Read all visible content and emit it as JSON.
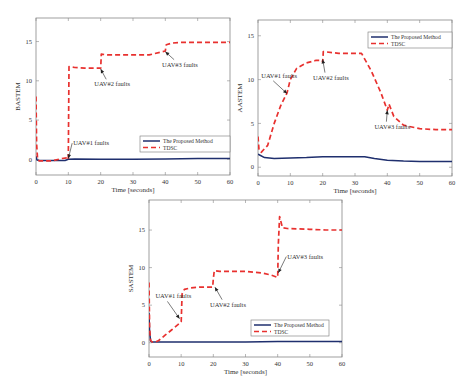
{
  "chart_data": [
    {
      "id": "bastem",
      "type": "line",
      "title": "",
      "xlabel": "Time [seconds]",
      "ylabel": "BASTEM",
      "xlim": [
        0,
        60
      ],
      "ylim": [
        -2,
        18
      ],
      "xticks": [
        0,
        10,
        20,
        30,
        40,
        50,
        60
      ],
      "yticks": [
        0,
        5,
        10,
        15
      ],
      "grid": false,
      "legend_position": "lower right",
      "frame": {
        "left": 36,
        "right": 230,
        "top": 18,
        "bottom": 175
      },
      "series": [
        {
          "name": "The Proposed Method",
          "style": "solid",
          "color": "#1f2f6e",
          "x": [
            0,
            0.3,
            1,
            5,
            9,
            10,
            12,
            20,
            30,
            40,
            50,
            60
          ],
          "y": [
            0.4,
            -0.1,
            -0.15,
            -0.15,
            -0.15,
            0.0,
            0.05,
            0.0,
            0.0,
            0.05,
            0.1,
            0.1
          ]
        },
        {
          "name": "TDSC",
          "style": "dashed",
          "color": "#e8312f",
          "x": [
            0,
            0.2,
            0.5,
            1,
            5,
            8,
            9.8,
            10,
            10.2,
            12,
            15,
            20,
            20.2,
            22,
            25,
            30,
            35,
            40,
            40.3,
            42,
            45,
            50,
            55,
            60
          ],
          "y": [
            8,
            2,
            0,
            -0.2,
            -0.2,
            0.1,
            0.2,
            0.0,
            11.8,
            11.7,
            11.6,
            11.6,
            13.4,
            13.3,
            13.3,
            13.3,
            13.3,
            13.8,
            14.6,
            14.8,
            14.9,
            14.9,
            14.9,
            14.9
          ]
        }
      ],
      "annotations": [
        {
          "text": "UAV#1 faults",
          "x": 11.5,
          "y": 1.8,
          "arrow_to": [
            10,
            0.1
          ]
        },
        {
          "text": "UAV#2 faults",
          "x": 18,
          "y": 9.3,
          "arrow_to": [
            20,
            11.5
          ]
        },
        {
          "text": "UAV#3 faults",
          "x": 39,
          "y": 11.8,
          "arrow_to": [
            40,
            13.7
          ]
        }
      ]
    },
    {
      "id": "aastem",
      "type": "line",
      "title": "",
      "xlabel": "Time [seconds]",
      "ylabel": "AASTEM",
      "xlim": [
        0,
        60
      ],
      "ylim": [
        -1,
        16.8
      ],
      "xticks": [
        0,
        10,
        20,
        30,
        40,
        50,
        60
      ],
      "yticks": [
        0,
        5,
        10,
        15
      ],
      "grid": false,
      "legend_position": "upper right",
      "frame": {
        "left": 258,
        "right": 452,
        "top": 20,
        "bottom": 176
      },
      "series": [
        {
          "name": "The Proposed Method",
          "style": "solid",
          "color": "#1f2f6e",
          "x": [
            0,
            0.5,
            2,
            5,
            10,
            15,
            20,
            25,
            30,
            33,
            36,
            40,
            45,
            50,
            60
          ],
          "y": [
            1.5,
            1.4,
            1.1,
            1.0,
            1.05,
            1.1,
            1.2,
            1.2,
            1.2,
            1.2,
            1.0,
            0.8,
            0.7,
            0.65,
            0.65
          ]
        },
        {
          "name": "TDSC",
          "style": "dashed",
          "color": "#e8312f",
          "x": [
            0,
            0.3,
            1,
            3,
            5,
            7,
            9,
            10,
            12,
            15,
            18,
            19.8,
            20,
            20.2,
            25,
            30,
            32,
            35,
            38,
            40,
            40.5,
            42,
            45,
            50,
            55,
            60
          ],
          "y": [
            3.5,
            2.0,
            1.7,
            2.5,
            5.0,
            7.0,
            8.5,
            10.0,
            11.3,
            11.9,
            12.2,
            12.2,
            12.0,
            13.2,
            13.0,
            13.0,
            13.0,
            11.0,
            8.5,
            6.5,
            7.2,
            5.8,
            4.8,
            4.4,
            4.3,
            4.3
          ]
        }
      ],
      "annotations": [
        {
          "text": "UAV#1 faults",
          "x": 1,
          "y": 10.2,
          "arrow_to": [
            9,
            8.4
          ]
        },
        {
          "text": "UAV#2 faults",
          "x": 17,
          "y": 10.0,
          "arrow_to": [
            20,
            12.3
          ]
        },
        {
          "text": "UAV#3 faults",
          "x": 36,
          "y": 4.4,
          "arrow_to": [
            40,
            6.5
          ]
        }
      ]
    },
    {
      "id": "sastem",
      "type": "line",
      "title": "",
      "xlabel": "Time [seconds]",
      "ylabel": "SASTEM",
      "xlim": [
        0,
        60
      ],
      "ylim": [
        -1.9,
        19
      ],
      "xticks": [
        0,
        10,
        20,
        30,
        40,
        50,
        60
      ],
      "yticks": [
        0,
        5,
        10,
        15
      ],
      "grid": false,
      "legend_position": "lower right",
      "frame": {
        "left": 149,
        "right": 342,
        "top": 200,
        "bottom": 357
      },
      "series": [
        {
          "name": "The Proposed Method",
          "style": "solid",
          "color": "#1f2f6e",
          "x": [
            0,
            0.2,
            0.5,
            1,
            5,
            10,
            20,
            30,
            40,
            50,
            60
          ],
          "y": [
            4.0,
            1.5,
            0.2,
            0.1,
            0.1,
            0.1,
            0.1,
            0.1,
            0.15,
            0.15,
            0.15
          ]
        },
        {
          "name": "TDSC",
          "style": "dashed",
          "color": "#e8312f",
          "x": [
            0,
            0.2,
            0.5,
            1,
            2,
            3,
            5,
            7,
            9,
            10,
            10.3,
            11,
            13,
            16,
            19.8,
            20,
            20.3,
            22,
            25,
            30,
            35,
            38,
            40,
            40.2,
            40.6,
            41.5,
            43,
            50,
            55,
            60
          ],
          "y": [
            8,
            2,
            0.3,
            0.1,
            0.1,
            0.3,
            1.0,
            1.7,
            2.4,
            2.8,
            6.5,
            7.1,
            7.3,
            7.4,
            7.4,
            8.5,
            9.6,
            9.5,
            9.5,
            9.5,
            9.3,
            9.0,
            8.7,
            13,
            16.8,
            15.3,
            15.2,
            15.1,
            15.0,
            15.0
          ]
        }
      ],
      "annotations": [
        {
          "text": "UAV#1 faults",
          "x": 2,
          "y": 5.9,
          "arrow_to": [
            9.5,
            3.2
          ]
        },
        {
          "text": "UAV#2 faults",
          "x": 19,
          "y": 4.8,
          "arrow_to": [
            20.5,
            7.4
          ]
        },
        {
          "text": "UAV#3 faults",
          "x": 43,
          "y": 11.2,
          "arrow_to": [
            40.2,
            9.3
          ]
        }
      ]
    }
  ],
  "legend": {
    "proposed_label": "The Proposed Method",
    "tdsc_label": "TDSC"
  },
  "legends": [
    {
      "chart": 0,
      "x": 140,
      "y": 136,
      "w": 90,
      "h": 16
    },
    {
      "chart": 1,
      "x": 368,
      "y": 32,
      "w": 84,
      "h": 16
    },
    {
      "chart": 2,
      "x": 251,
      "y": 320,
      "w": 78,
      "h": 16
    }
  ]
}
